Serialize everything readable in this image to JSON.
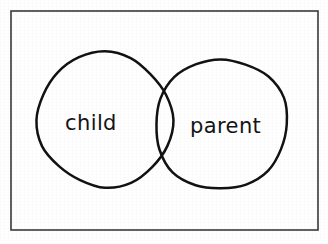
{
  "figure": {
    "kind": "venn-diagram",
    "caption": "",
    "background_color": "#ffffff",
    "ink_color": "#121212",
    "frame_color": "#3a3a3c",
    "style": "hand-drawn"
  },
  "frame": {
    "name": "outer-border",
    "x": 11,
    "y": 11,
    "width": 307,
    "height": 219,
    "stroke_width": 1.6
  },
  "sets": [
    {
      "id": "child",
      "label": "child",
      "cx": 105,
      "cy": 120,
      "r": 67,
      "label_x": 65,
      "label_y": 130
    },
    {
      "id": "parent",
      "label": "parent",
      "cx": 221,
      "cy": 124,
      "r": 66,
      "label_x": 190,
      "label_y": 133
    }
  ],
  "intersection": {
    "name": "overlap-lens",
    "label": "",
    "upper_crossing": {
      "x": 158,
      "y": 72
    },
    "lower_crossing": {
      "x": 158,
      "y": 173
    }
  }
}
